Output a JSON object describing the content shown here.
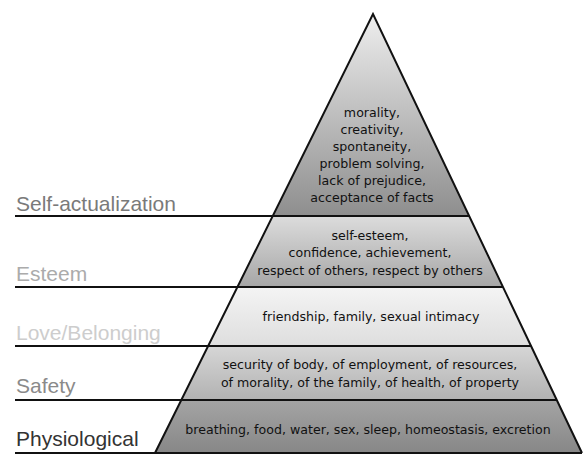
{
  "diagram": {
    "type": "pyramid",
    "tiers": [
      {
        "label": "Self-actualization",
        "label_color": "#7a7a7a",
        "description_lines": [
          "morality,",
          "creativity,",
          "spontaneity,",
          "problem solving,",
          "lack of prejudice,",
          "acceptance of facts"
        ],
        "fill_top": "#eeeeee",
        "fill_bottom": "#8e8e8e"
      },
      {
        "label": "Esteem",
        "label_color": "#ababab",
        "description_lines": [
          "self-esteem,",
          "confidence, achievement,",
          "respect of others, respect by others"
        ],
        "fill_top": "#dcdcdc",
        "fill_bottom": "#a6a6a6"
      },
      {
        "label": "Love/Belonging",
        "label_color": "#cdcdcd",
        "description_lines": [
          "friendship, family, sexual intimacy"
        ],
        "fill_top": "#f4f4f4",
        "fill_bottom": "#dedede"
      },
      {
        "label": "Safety",
        "label_color": "#8a8a8a",
        "description_lines": [
          "security of body, of employment, of resources,",
          "of morality, of the family, of health, of property"
        ],
        "fill_top": "#d6d6d6",
        "fill_bottom": "#b2b2b2"
      },
      {
        "label": "Physiological",
        "label_color": "#333333",
        "description_lines": [
          "breathing, food, water, sex, sleep, homeostasis, excretion"
        ],
        "fill_top": "#a4a4a4",
        "fill_bottom": "#878787"
      }
    ]
  }
}
